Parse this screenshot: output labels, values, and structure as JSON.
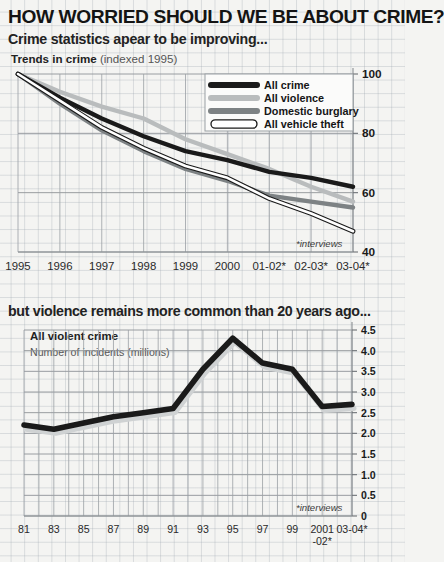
{
  "header": {
    "title": "HOW WORRIED SHOULD WE BE ABOUT CRIME?",
    "subtitle_top": "Crime statistics apear to be improving...",
    "subtitle_bottom": "but violence remains more common than 20 years ago..."
  },
  "chart1_meta": {
    "title_bold": "Trends in crime",
    "title_light": "(indexed 1995)",
    "note": "*interviews"
  },
  "chart2_meta": {
    "title": "All violent crime",
    "subtitle": "Number of incidents (millions)",
    "note": "*interviews"
  },
  "colors": {
    "all_crime": "#1a1a1a",
    "all_violence": "#b9bcbd",
    "domestic_burglary": "#7d8284",
    "all_vehicle_theft": "#ffffff",
    "background": "#f4f4f2",
    "grid": "#8e9397"
  },
  "chart_data": [
    {
      "type": "line",
      "title": "Trends in crime (indexed 1995)",
      "xlabel": "",
      "ylabel": "Index (1995 = 100)",
      "ylim": [
        40,
        100
      ],
      "yticks": [
        40,
        60,
        80,
        100
      ],
      "ytick_labels": [
        "40",
        "60",
        "80",
        "100"
      ],
      "grid": true,
      "legend_position": "top-right",
      "annotation": "*interviews",
      "categories": [
        "1995",
        "1996",
        "1997",
        "1998",
        "1999",
        "2000",
        "01-02*",
        "02-03*",
        "03-04*"
      ],
      "series": [
        {
          "name": "All crime",
          "color": "#1a1a1a",
          "values": [
            100,
            92,
            85,
            79,
            74,
            71,
            67,
            65,
            62
          ]
        },
        {
          "name": "All violence",
          "color": "#b9bcbd",
          "values": [
            100,
            94,
            89,
            85,
            78,
            73,
            68,
            62,
            57
          ]
        },
        {
          "name": "Domestic burglary",
          "color": "#7d8284",
          "values": [
            100,
            90,
            81,
            74,
            68,
            64,
            59,
            57,
            55
          ]
        },
        {
          "name": "All vehicle theft",
          "color": "#ffffff",
          "values": [
            100,
            91,
            82,
            75,
            69,
            65,
            58,
            53,
            47
          ]
        }
      ]
    },
    {
      "type": "line",
      "title": "All violent crime",
      "subtitle": "Number of incidents (millions)",
      "xlabel": "",
      "ylabel": "Number of incidents (millions)",
      "ylim": [
        0,
        4.5
      ],
      "yticks": [
        0,
        0.5,
        1.0,
        1.5,
        2.0,
        2.5,
        3.0,
        3.5,
        4.0,
        4.5
      ],
      "ytick_labels": [
        "0",
        "0.5",
        "1.0",
        "1.5",
        "2.0",
        "2.5",
        "3.0",
        "3.5",
        "4.0",
        "4.5"
      ],
      "grid": true,
      "annotation": "*interviews",
      "categories": [
        "81",
        "83",
        "85",
        "87",
        "89",
        "91",
        "93",
        "95",
        "97",
        "99",
        "2001-02*",
        "03-04*"
      ],
      "xtick_labels_line1": [
        "81",
        "83",
        "85",
        "87",
        "89",
        "91",
        "93",
        "95",
        "97",
        "99",
        "2001",
        "03-04*"
      ],
      "xtick_labels_line2": [
        "",
        "",
        "",
        "",
        "",
        "",
        "",
        "",
        "",
        "",
        "-02*",
        ""
      ],
      "series": [
        {
          "name": "All violent crime",
          "color": "#1a1a1a",
          "values": [
            2.2,
            2.1,
            2.25,
            2.4,
            2.5,
            2.6,
            3.55,
            4.3,
            3.7,
            3.55,
            2.65,
            2.7
          ]
        }
      ]
    }
  ],
  "legend1": [
    {
      "label": "All crime",
      "style": "solid-black"
    },
    {
      "label": "All violence",
      "style": "solid-light"
    },
    {
      "label": "Domestic burglary",
      "style": "solid-grey"
    },
    {
      "label": "All vehicle theft",
      "style": "outline-white"
    }
  ]
}
